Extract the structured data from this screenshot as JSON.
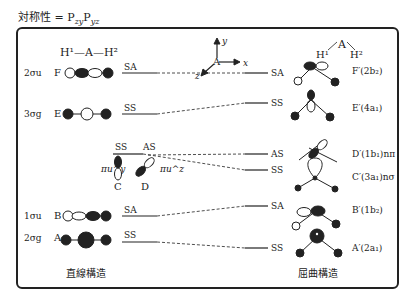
{
  "title": "対称性 = P",
  "title_sub1": "zy",
  "title_p2": "P",
  "title_sub2": "yz",
  "linear": {
    "header": "H¹—A—H²",
    "caption": "直線構造",
    "orbitals": [
      {
        "sym": "2σu",
        "letter": "F",
        "label": "SA"
      },
      {
        "sym": "3σg",
        "letter": "E",
        "label": "SS"
      },
      {
        "sym": "πu^y",
        "letter": "C",
        "label": "SS"
      },
      {
        "sym": "πu^z",
        "letter": "D",
        "label": "AS"
      },
      {
        "sym": "1σu",
        "letter": "B",
        "label": "SA"
      },
      {
        "sym": "2σg",
        "letter": "A",
        "label": "SS"
      }
    ]
  },
  "axes": {
    "y": "y",
    "x": "x",
    "z": "z",
    "center": "A"
  },
  "bent": {
    "header_a": "A",
    "header_h1": "H¹",
    "header_h2": "H²",
    "caption": "屈曲構造",
    "orbitals": [
      {
        "label": "SA",
        "name": "F′(2b₂)"
      },
      {
        "label": "SS",
        "name": "E′(4a₁)"
      },
      {
        "label": "AS",
        "name": "D′(1b₁)nπ"
      },
      {
        "label": "SS",
        "name": "C′(3a₁)nσ"
      },
      {
        "label": "SA",
        "name": "B′(1b₂)"
      },
      {
        "label": "SS",
        "name": "A′(2a₁)"
      }
    ]
  }
}
